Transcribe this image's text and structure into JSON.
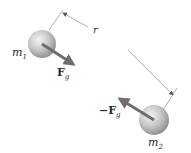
{
  "diagram": {
    "type": "gravitational-force-between-two-masses",
    "mass1": {
      "label": "m",
      "subscript": "1"
    },
    "mass2": {
      "label": "m",
      "subscript": "2"
    },
    "force1": {
      "label": "F",
      "subscript": "g"
    },
    "force2": {
      "prefix": "−",
      "label": "F",
      "subscript": "g"
    },
    "distance": {
      "label": "r"
    },
    "colors": {
      "sphere_light": "#f2f2f2",
      "sphere_dark": "#8c8c8c",
      "arrow": "#6e6e6e",
      "line": "#9a9a9a",
      "text": "#2a2a2a"
    }
  }
}
